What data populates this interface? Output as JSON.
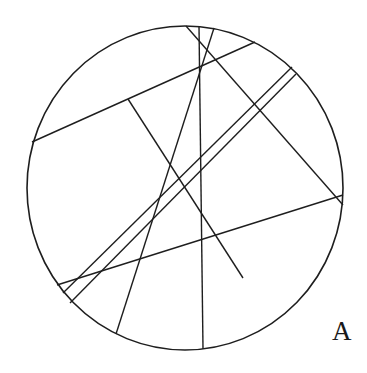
{
  "figure": {
    "label": "A",
    "stroke_color": "#1e1e1e",
    "background": "#ffffff",
    "circle": {
      "cx": 185,
      "cy": 188,
      "rx": 158,
      "ry": 162
    },
    "lines": [
      {
        "name": "upper-chord",
        "x1": 32,
        "y1": 142,
        "x2": 255,
        "y2": 42
      },
      {
        "name": "branch-line",
        "x1": 128,
        "y1": 99,
        "x2": 243,
        "y2": 278
      },
      {
        "name": "long-diagonal-a",
        "x1": 186,
        "y1": 26,
        "x2": 343,
        "y2": 205
      },
      {
        "name": "vertical-line",
        "x1": 199,
        "y1": 26,
        "x2": 203,
        "y2": 349
      },
      {
        "name": "steep-line-c",
        "x1": 214,
        "y1": 28,
        "x2": 116,
        "y2": 334
      },
      {
        "name": "lower-chord",
        "x1": 57,
        "y1": 285,
        "x2": 343,
        "y2": 195
      },
      {
        "name": "double-line-1",
        "x1": 63,
        "y1": 293,
        "x2": 292,
        "y2": 67
      },
      {
        "name": "double-line-2",
        "x1": 70,
        "y1": 303,
        "x2": 296,
        "y2": 74
      }
    ]
  }
}
